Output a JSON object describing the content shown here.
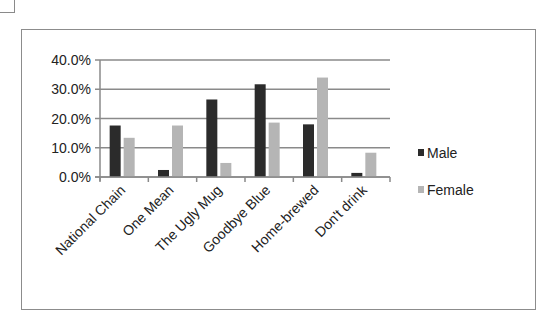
{
  "chart_data": {
    "type": "bar",
    "title": "",
    "xlabel": "",
    "ylabel": "",
    "categories": [
      "National Chain",
      "One Mean",
      "The Ugly Mug",
      "Goodbye Blue",
      "Home-brewed",
      "Don't drink"
    ],
    "series": [
      {
        "name": "Male",
        "color": "#2b2b2b",
        "values": [
          17.6,
          2.4,
          26.5,
          31.7,
          18.0,
          1.4
        ]
      },
      {
        "name": "Female",
        "color": "#b5b5b5",
        "values": [
          13.4,
          17.6,
          4.8,
          18.6,
          34.0,
          8.3
        ]
      }
    ],
    "ylim": [
      0,
      40
    ],
    "yticks": [
      "0.0%",
      "10.0%",
      "20.0%",
      "30.0%",
      "40.0%"
    ],
    "grid": true,
    "legend_position": "right"
  },
  "legend": {
    "male_label": "Male",
    "female_label": "Female"
  }
}
